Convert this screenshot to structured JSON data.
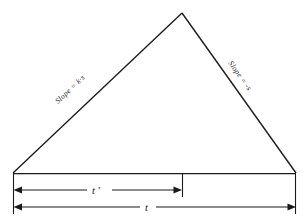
{
  "figure": {
    "background_color": "#ffffff",
    "ink_color": "#1a1a1a"
  },
  "triangle": {
    "apex": {
      "x": 182,
      "y": 13
    },
    "base_left": {
      "x": 13,
      "y": 173
    },
    "base_right": {
      "x": 296,
      "y": 173
    },
    "left_side_label": "Slope = k·s",
    "right_side_label": "Slope = -s"
  },
  "dimensions": [
    {
      "name": "t-prime",
      "label": "t '",
      "from_x": 13,
      "to_x": 182,
      "y": 190,
      "arrow_left": true,
      "arrow_right": true
    },
    {
      "name": "t-total",
      "label": "t",
      "from_x": 13,
      "to_x": 296,
      "y": 207,
      "arrow_left": true,
      "arrow_right": true
    }
  ],
  "extension_lines": [
    {
      "name": "left-extension",
      "x": 13,
      "y1": 174,
      "y2": 214
    },
    {
      "name": "mid-extension",
      "x": 182,
      "y1": 174,
      "y2": 197
    },
    {
      "name": "right-extension",
      "x": 296,
      "y1": 174,
      "y2": 214
    }
  ]
}
